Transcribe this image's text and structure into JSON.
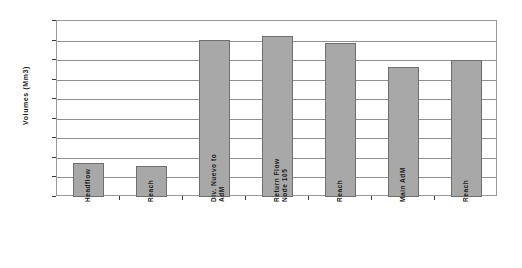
{
  "chart_data": {
    "type": "bar",
    "title": "",
    "xlabel": "",
    "ylabel": "Volumes (Mm3)",
    "ylim": [
      70,
      250
    ],
    "ytick_step": 20,
    "yticks": [
      70,
      90,
      110,
      130,
      150,
      170,
      190,
      210,
      230,
      250
    ],
    "grid": true,
    "legend": "none",
    "bar_color": "#a8a8a8",
    "bar_border_color": "#6e6e6e",
    "categories": [
      "Headflow",
      "Reach",
      "Div. Nuevo to AdM",
      "Return Flow Node 105",
      "Reach",
      "Main AdM",
      "Reach"
    ],
    "values": [
      105,
      102,
      231,
      235,
      228,
      203,
      210
    ]
  },
  "axis": {
    "y_title": "Volumes (Mm3)",
    "y_labels": [
      "250",
      "230",
      "210",
      "190",
      "170",
      "150",
      "130",
      "110",
      "90",
      "70"
    ],
    "x_labels": [
      "Headflow",
      "Reach",
      "Div. Nuevo to\nAdM",
      "Return Flow\nNode 105",
      "Reach",
      "Main AdM",
      "Reach"
    ]
  }
}
